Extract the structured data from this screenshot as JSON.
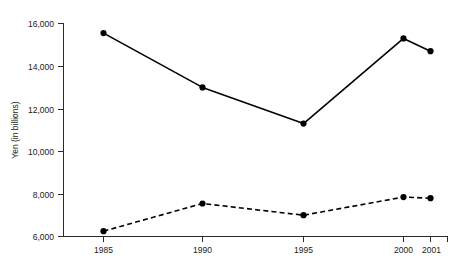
{
  "chart_data": {
    "type": "line",
    "title": "",
    "subtitle": "",
    "xlabel": "",
    "ylabel": "Yen (in billions)",
    "categories": [
      "1985",
      "1990",
      "1995",
      "2000",
      "2001"
    ],
    "x": [
      1985,
      1990,
      1995,
      2000,
      2001
    ],
    "xlim": [
      1983.7,
      1985,
      2001
    ],
    "ylim": [
      6000,
      16000
    ],
    "y_ticks": [
      6000,
      8000,
      10000,
      12000,
      14000,
      16000
    ],
    "y_tick_labels": [
      "6,000",
      "8,000",
      "10,000",
      "12,000",
      "14,000",
      "16,000"
    ],
    "x_tick_labels": [
      "1985",
      "1990",
      "1995",
      "2000",
      "2001"
    ],
    "grid": false,
    "legend": false,
    "legend_position": "none",
    "series": [
      {
        "name": "series-solid",
        "line_style": "solid",
        "marker": "circle",
        "color": "#000000",
        "values": [
          15550,
          13000,
          11300,
          15300,
          14700
        ]
      },
      {
        "name": "series-dashed",
        "line_style": "dashed",
        "marker": "circle",
        "color": "#000000",
        "values": [
          6250,
          7550,
          7000,
          7850,
          7800
        ]
      }
    ],
    "annotations": []
  },
  "axes": {
    "y_axis_title": "Yen (in billions)"
  },
  "colors": {
    "background": "#ffffff",
    "ink": "#000000",
    "axis": "#2a2a2a",
    "text": "#1a1a1a"
  }
}
